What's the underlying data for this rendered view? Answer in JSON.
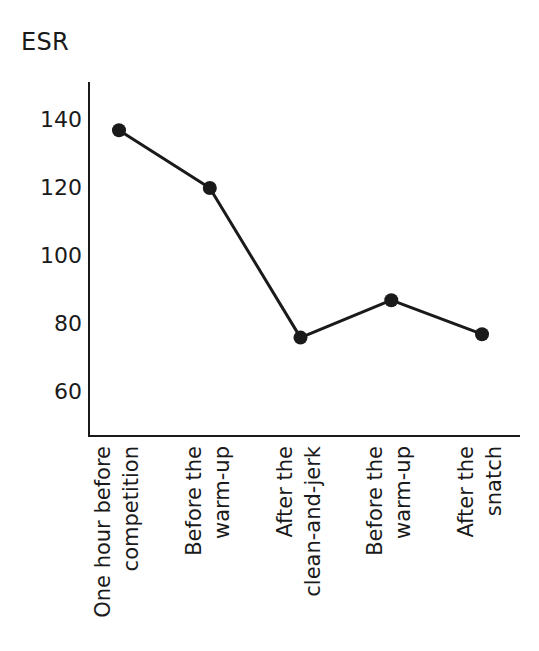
{
  "chart_data": {
    "type": "line",
    "title": "ESR",
    "xlabel": "",
    "ylabel": "ESR",
    "categories": [
      "One hour before competition",
      "Before the warm-up",
      "After the clean-and-jerk",
      "Before the warm-up",
      "After the snatch"
    ],
    "category_lines": [
      [
        "One hour before",
        "competition"
      ],
      [
        "Before the",
        "warm-up"
      ],
      [
        "After the",
        "clean-and-jerk"
      ],
      [
        "Before the",
        "warm-up"
      ],
      [
        "After the",
        "snatch"
      ]
    ],
    "values": [
      137,
      120,
      76,
      87,
      77
    ],
    "yticks": [
      140,
      120,
      100,
      80,
      60
    ],
    "ytick_labels": [
      "140",
      "120",
      "100",
      "80",
      "60"
    ],
    "ylim": [
      50,
      150
    ],
    "grid": false,
    "legend": false,
    "line_color": "#1a1a1a",
    "marker_color": "#1a1a1a",
    "marker": "circle",
    "axis_color": "#1a1a1a",
    "background": "#ffffff"
  }
}
